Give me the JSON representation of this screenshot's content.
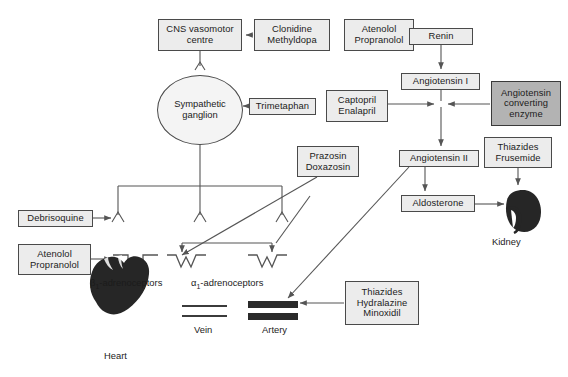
{
  "diagram": {
    "colors": {
      "box_fill": "#ececec",
      "box_fill_shaded": "#b3b3b3",
      "border": "#4a4a4a",
      "line": "#555555",
      "organ": "#262626",
      "text": "#1b1b1b"
    },
    "nodes": [
      {
        "id": "cns",
        "lines": [
          "CNS vasomotor",
          "centre"
        ],
        "shaded": false,
        "x": 158,
        "y": 19,
        "w": 84,
        "h": 32
      },
      {
        "id": "clonidine",
        "lines": [
          "Clonidine",
          "Methyldopa"
        ],
        "shaded": false,
        "x": 254,
        "y": 19,
        "w": 76,
        "h": 32
      },
      {
        "id": "atenolol1",
        "lines": [
          "Atenolol",
          "Propranolol"
        ],
        "shaded": false,
        "x": 344,
        "y": 19,
        "w": 70,
        "h": 32
      },
      {
        "id": "renin",
        "lines": [
          "Renin"
        ],
        "shaded": false,
        "x": 409,
        "y": 28,
        "w": 64,
        "h": 17
      },
      {
        "id": "angio1",
        "lines": [
          "Angiotensin I"
        ],
        "shaded": false,
        "x": 401,
        "y": 73,
        "w": 79,
        "h": 17
      },
      {
        "id": "ace",
        "lines": [
          "Angiotensin",
          "converting",
          "enzyme"
        ],
        "shaded": true,
        "x": 491,
        "y": 81,
        "w": 70,
        "h": 45
      },
      {
        "id": "captopril",
        "lines": [
          "Captopril",
          "Enalapril"
        ],
        "shaded": false,
        "x": 326,
        "y": 90,
        "w": 62,
        "h": 32
      },
      {
        "id": "trimetaphan",
        "lines": [
          "Trimetaphan"
        ],
        "shaded": false,
        "x": 249,
        "y": 98,
        "w": 67,
        "h": 17
      },
      {
        "id": "prazosin",
        "lines": [
          "Prazosin",
          "Doxazosin"
        ],
        "shaded": false,
        "x": 297,
        "y": 146,
        "w": 62,
        "h": 31
      },
      {
        "id": "angio2",
        "lines": [
          "Angiotensin II"
        ],
        "shaded": false,
        "x": 399,
        "y": 150,
        "w": 80,
        "h": 17
      },
      {
        "id": "thiazfru",
        "lines": [
          "Thiazides",
          "Frusemide"
        ],
        "shaded": false,
        "x": 484,
        "y": 137,
        "w": 68,
        "h": 31
      },
      {
        "id": "aldosterone",
        "lines": [
          "Aldosterone"
        ],
        "shaded": false,
        "x": 401,
        "y": 195,
        "w": 74,
        "h": 17
      },
      {
        "id": "debrisoquine",
        "lines": [
          "Debrisoquine"
        ],
        "shaded": false,
        "x": 18,
        "y": 210,
        "w": 75,
        "h": 17
      },
      {
        "id": "atenolol2",
        "lines": [
          "Atenolol",
          "Propranolol"
        ],
        "shaded": false,
        "x": 18,
        "y": 244,
        "w": 73,
        "h": 31
      },
      {
        "id": "thiazhydmin",
        "lines": [
          "Thiazides",
          "Hydralazine",
          "Minoxidil"
        ],
        "shaded": false,
        "x": 345,
        "y": 281,
        "w": 74,
        "h": 44
      }
    ],
    "ganglion": {
      "id": "ganglion",
      "lines": [
        "Sympathetic",
        "ganglion"
      ],
      "x": 157,
      "y": 75,
      "w": 86,
      "h": 70
    },
    "captions": [
      {
        "id": "beta1-label",
        "html": "β<sub>1</sub>-adrenoceptors",
        "x": 90,
        "y": 277
      },
      {
        "id": "alpha1-label",
        "html": "α<sub>1</sub>-adrenoceptors",
        "x": 191,
        "y": 277
      },
      {
        "id": "vein-label",
        "html": "Vein",
        "x": 194,
        "y": 330
      },
      {
        "id": "artery-label",
        "html": "Artery",
        "x": 262,
        "y": 330
      },
      {
        "id": "heart-label",
        "html": "Heart",
        "x": 104,
        "y": 356
      },
      {
        "id": "kidney-label",
        "html": "Kidney",
        "x": 492,
        "y": 238
      }
    ],
    "organs": [
      {
        "id": "heart",
        "label": "Heart"
      },
      {
        "id": "kidney",
        "label": "Kidney"
      }
    ],
    "receptors": [
      {
        "id": "beta1-receptor",
        "type": "smooth"
      },
      {
        "id": "alpha1-receptor-vein",
        "type": "jagged"
      },
      {
        "id": "alpha1-receptor-artery",
        "type": "jagged"
      }
    ],
    "vessels": [
      {
        "id": "vein",
        "label": "Vein",
        "style": "thin"
      },
      {
        "id": "artery",
        "label": "Artery",
        "style": "thick"
      }
    ]
  }
}
